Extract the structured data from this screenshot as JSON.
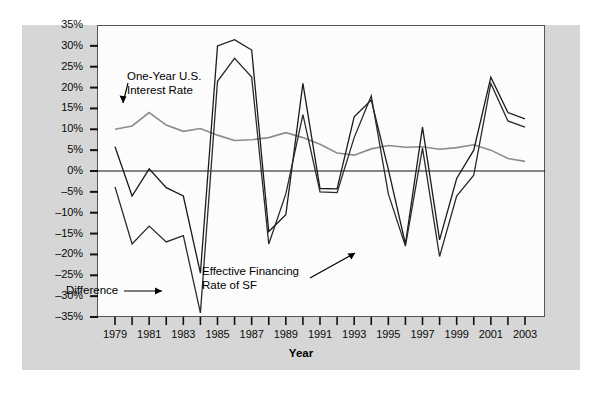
{
  "figure": {
    "background_color": "#d6d6d6",
    "plot_background_color": "#fcfcfc",
    "frame_color": "#555555"
  },
  "axis_title": "Year",
  "annotations": [
    {
      "id": "interest-rate",
      "line1": "One-Year U.S.",
      "line2": "Interest Rate"
    },
    {
      "id": "effective-financing",
      "line1": "Effective Financing",
      "line2": "Rate of SF"
    },
    {
      "id": "difference",
      "line1": "Difference",
      "line2": ""
    }
  ],
  "chart_data": {
    "type": "line",
    "title": "",
    "xlabel": "Year",
    "ylabel": "",
    "grid": false,
    "legend": "annotations-inline",
    "xlim": [
      1979,
      2003
    ],
    "ylim": [
      -35,
      35
    ],
    "ytick_labels": [
      "35%",
      "30%",
      "25%",
      "20%",
      "15%",
      "10%",
      "5%",
      "0%",
      "-5%",
      "-10%",
      "-15%",
      "-20%",
      "-25%",
      "-30%",
      "-35%"
    ],
    "ytick_values": [
      35,
      30,
      25,
      20,
      15,
      10,
      5,
      0,
      -5,
      -10,
      -15,
      -20,
      -25,
      -30,
      -35
    ],
    "xtick_labels": [
      "1979",
      "1981",
      "1983",
      "1985",
      "1987",
      "1989",
      "1991",
      "1993",
      "1995",
      "1997",
      "1999",
      "2001",
      "2003"
    ],
    "xtick_values": [
      1979,
      1981,
      1983,
      1985,
      1987,
      1989,
      1991,
      1993,
      1995,
      1997,
      1999,
      2001,
      2003
    ],
    "x": [
      1979,
      1980,
      1981,
      1982,
      1983,
      1984,
      1985,
      1986,
      1987,
      1988,
      1989,
      1990,
      1991,
      1992,
      1993,
      1994,
      1995,
      1996,
      1997,
      1998,
      1999,
      2000,
      2001,
      2002,
      2003
    ],
    "series": [
      {
        "name": "One-Year U.S. Interest Rate",
        "color": "#8c8c8c",
        "width": 1.6,
        "values": [
          10.0,
          10.8,
          14.0,
          11.0,
          9.5,
          10.2,
          8.6,
          7.3,
          7.5,
          8.0,
          9.2,
          8.0,
          6.4,
          4.3,
          3.8,
          5.3,
          6.1,
          5.7,
          5.8,
          5.2,
          5.6,
          6.3,
          5.0,
          3.0,
          2.3
        ]
      },
      {
        "name": "Effective Financing Rate of SF",
        "color": "#1a1a1a",
        "width": 1.3,
        "values": [
          5.8,
          -6.0,
          0.5,
          -4.0,
          -6.0,
          -24.5,
          30.0,
          31.5,
          29.0,
          -14.5,
          -10.5,
          21.0,
          -4.2,
          -4.3,
          13.0,
          17.0,
          0.4,
          -17.5,
          10.5,
          -16.5,
          -1.8,
          5.0,
          22.5,
          14.0,
          12.5
        ]
      },
      {
        "name": "Difference",
        "color": "#2b2b2b",
        "width": 1.3,
        "values": [
          -3.8,
          -17.5,
          -13.2,
          -17.0,
          -15.5,
          -34.0,
          21.5,
          27.0,
          22.5,
          -17.5,
          -5.5,
          13.5,
          -5.0,
          -5.2,
          8.0,
          18.0,
          -5.5,
          -18.0,
          5.5,
          -20.5,
          -6.0,
          -1.0,
          21.0,
          12.0,
          10.5
        ]
      }
    ]
  }
}
